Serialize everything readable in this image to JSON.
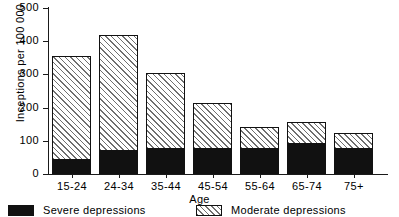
{
  "chart_data": {
    "type": "bar",
    "subtype": "stacked-vertical-bar",
    "title": "",
    "xlabel": "Age",
    "ylabel": "Inceptions per 100 000",
    "categories": [
      "15-24",
      "24-34",
      "35-44",
      "45-54",
      "55-64",
      "65-74",
      "75+"
    ],
    "series": [
      {
        "name": "Severe depressions",
        "values": [
          45,
          72,
          79,
          79,
          79,
          94,
          79
        ],
        "fill": "solid-black",
        "color": "#111111"
      },
      {
        "name": "Moderate depressions",
        "values": [
          312,
          349,
          227,
          139,
          66,
          66,
          48
        ],
        "fill": "diagonal-hatch",
        "color": "#6f6f6f"
      }
    ],
    "totals": [
      357,
      421,
      306,
      218,
      145,
      160,
      127
    ],
    "ylim": [
      0,
      500
    ],
    "yticks": [
      0,
      100,
      200,
      300,
      400,
      500
    ],
    "ytick_labels": [
      "0",
      "100",
      "200",
      "300",
      "400",
      "500"
    ],
    "grid": false,
    "legend_position": "bottom"
  },
  "legend": {
    "items": [
      {
        "label": "Severe depressions",
        "swatch": "solid-black-swatch"
      },
      {
        "label": "Moderate depressions",
        "swatch": "hatched-swatch"
      }
    ]
  },
  "colors": {
    "axis": "#1a1a1a",
    "severe": "#111111",
    "moderate_hatch": "#6f6f6f",
    "background": "#ffffff"
  }
}
